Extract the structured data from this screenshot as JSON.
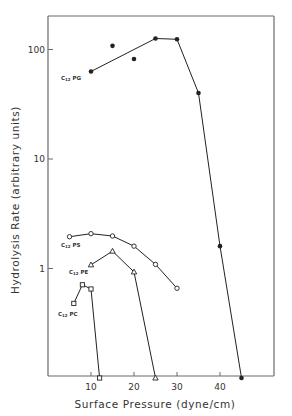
{
  "chart_data": {
    "type": "line",
    "title": "",
    "xlabel": "Surface Pressure (dyne/cm)",
    "ylabel": "Hydrolysis Rate (arbitrary units)",
    "xscale": "linear",
    "yscale": "log",
    "xlim": [
      0,
      53
    ],
    "ylim": [
      0.1,
      250
    ],
    "xticks": [
      10,
      20,
      30,
      40
    ],
    "yticks": [
      1,
      10,
      100
    ],
    "grid": false,
    "legend": "inline labels near each series",
    "series": [
      {
        "name": "C12 PG",
        "label": "C",
        "label_sub": "12",
        "label_tail": " PG",
        "marker": "filled-circle",
        "line_points": [
          [
            10,
            63
          ],
          [
            25,
            126
          ],
          [
            30,
            124
          ],
          [
            35,
            40
          ],
          [
            40,
            1.6
          ],
          [
            45,
            0.1
          ]
        ],
        "scatter_only": [
          [
            15,
            108
          ],
          [
            20,
            82
          ]
        ],
        "x": [
          10,
          15,
          20,
          25,
          30,
          35,
          40,
          45
        ],
        "y": [
          63,
          108,
          82,
          126,
          124,
          40,
          1.6,
          0.1
        ]
      },
      {
        "name": "C12 PS",
        "label": "C",
        "label_sub": "12",
        "label_tail": " PS",
        "marker": "open-circle",
        "x": [
          5,
          10,
          15,
          20,
          25,
          30
        ],
        "y": [
          1.95,
          2.08,
          1.98,
          1.6,
          1.09,
          0.66
        ]
      },
      {
        "name": "C12 PE",
        "label": "C",
        "label_sub": "12",
        "label_tail": " PE",
        "marker": "open-triangle",
        "x": [
          10,
          15,
          20,
          25
        ],
        "y": [
          1.08,
          1.44,
          0.93,
          0.1
        ]
      },
      {
        "name": "C12 PC",
        "label": "C",
        "label_sub": "12",
        "label_tail": " PC",
        "marker": "open-square",
        "x": [
          6,
          8,
          10,
          12
        ],
        "y": [
          0.48,
          0.71,
          0.65,
          0.1
        ]
      }
    ]
  },
  "axes": {
    "x_title": "Surface Pressure (dyne/cm)",
    "y_title": "Hydrolysis Rate (arbitrary units)",
    "x_tick_labels": [
      "10",
      "20",
      "30",
      "40"
    ],
    "y_tick_labels": [
      "1",
      "10",
      "100"
    ]
  },
  "colors": {
    "ink": "#222222",
    "frame": "#6a6a6a",
    "background": "#ffffff"
  }
}
